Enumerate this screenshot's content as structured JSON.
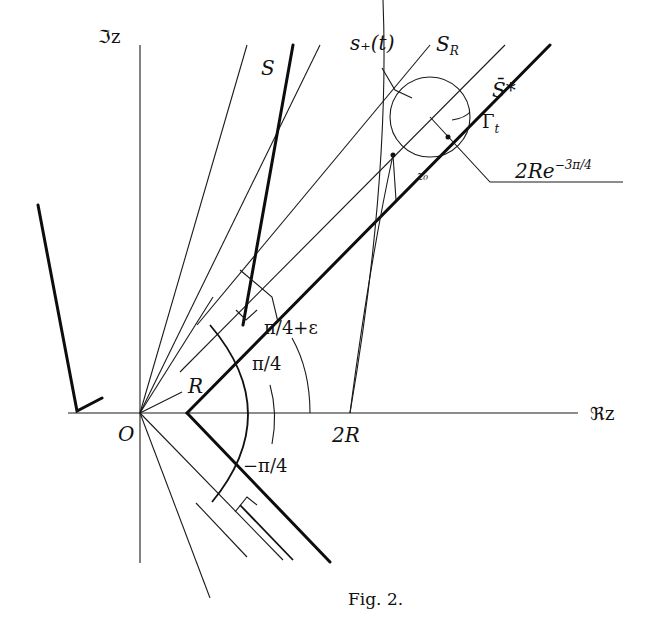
{
  "figure": {
    "caption": "Fig. 2.",
    "labels": {
      "imag_axis": "ℑz",
      "real_axis": "ℜz",
      "origin": "O",
      "S": "S",
      "s_plus": "s₊(t)",
      "S_R_main": "S",
      "S_R_sub": "R",
      "S_bar_star": "S̄*",
      "Gamma_t_main": "Γ",
      "Gamma_t_sub": "t",
      "radius_main": "2Re",
      "radius_sup": "−3π/4",
      "z0": "z₀",
      "angle_pi4_eps": "π/4+ε",
      "angle_pi4": "π/4",
      "angle_neg_pi4": "−π/4",
      "R": "R",
      "two_R": "2R"
    }
  }
}
